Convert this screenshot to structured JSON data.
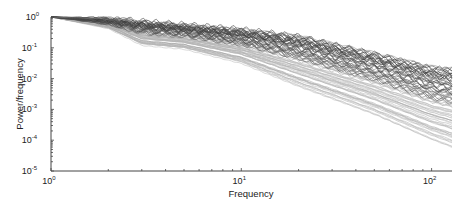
{
  "chart_data": {
    "type": "line",
    "title": "",
    "xlabel": "Frequency",
    "ylabel": "Power/frequency",
    "xscale": "log",
    "yscale": "log",
    "xlim": [
      1,
      128
    ],
    "ylim": [
      1e-05,
      1
    ],
    "grid": false,
    "legend": null,
    "x_ticks": [
      {
        "base": "10",
        "exp": "0",
        "value": 1
      },
      {
        "base": "10",
        "exp": "1",
        "value": 10
      },
      {
        "base": "10",
        "exp": "2",
        "value": 100
      }
    ],
    "y_ticks": [
      {
        "base": "10",
        "exp": "0",
        "value": 1
      },
      {
        "base": "10",
        "exp": "-1",
        "value": 0.1
      },
      {
        "base": "10",
        "exp": "-2",
        "value": 0.01
      },
      {
        "base": "10",
        "exp": "-3",
        "value": 0.001
      },
      {
        "base": "10",
        "exp": "-4",
        "value": 0.0001
      },
      {
        "base": "10",
        "exp": "-5",
        "value": 1e-05
      }
    ],
    "series_description": "Approximately 80 normalized power spectral density curves (grayscale, dark to light). All start at 1.0 at frequency 1 and decay with frequency; spread widens with frequency. Darker curves remain higher (ending ~1e-2 to 1e-3 at 128 Hz) with oscillatory ripples; lighter curves decay faster (ending ~1e-3 to 5e-5).",
    "envelope": {
      "x": [
        1,
        2,
        3,
        5,
        10,
        20,
        50,
        100,
        128
      ],
      "upper": [
        1.0,
        0.85,
        0.7,
        0.55,
        0.4,
        0.25,
        0.07,
        0.025,
        0.022
      ],
      "lower": [
        1.0,
        0.45,
        0.12,
        0.09,
        0.03,
        0.005,
        0.0006,
        9e-05,
        5e-05
      ]
    },
    "series": [
      {
        "name": "top-dark",
        "shade": "#555555",
        "values_at_envelope_x": [
          1.0,
          0.85,
          0.7,
          0.55,
          0.4,
          0.25,
          0.07,
          0.025,
          0.022
        ]
      },
      {
        "name": "mid-dark",
        "shade": "#444444",
        "values_at_envelope_x": [
          1.0,
          0.6,
          0.3,
          0.2,
          0.12,
          0.05,
          0.012,
          0.005,
          0.004
        ]
      },
      {
        "name": "mid-light",
        "shade": "#aaaaaa",
        "values_at_envelope_x": [
          1.0,
          0.55,
          0.2,
          0.12,
          0.05,
          0.01,
          0.0015,
          0.0004,
          0.0003
        ]
      },
      {
        "name": "bottom-light",
        "shade": "#bbbbbb",
        "values_at_envelope_x": [
          1.0,
          0.45,
          0.12,
          0.09,
          0.03,
          0.005,
          0.0006,
          9e-05,
          5e-05
        ]
      }
    ],
    "curve_count": 80
  },
  "plot_box": {
    "left": 51,
    "top": 17,
    "right": 452,
    "bottom": 171
  },
  "colors": {
    "axis": "#444444",
    "dark_line": "#3a3a3a",
    "light_line": "#bdbdbd",
    "background": "#ffffff"
  }
}
